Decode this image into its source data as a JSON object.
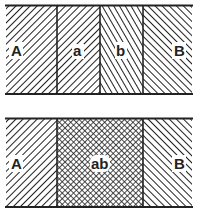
{
  "diagram": {
    "colors": {
      "line": "#222222",
      "background": "#ffffff"
    },
    "top_panel": {
      "regions": [
        {
          "label": "A",
          "pattern": "diagonal-hatch-right"
        },
        {
          "label": "a",
          "pattern": "diagonal-hatch-right"
        },
        {
          "label": "b",
          "pattern": "steep-diagonal-hatch-left"
        },
        {
          "label": "B",
          "pattern": "diagonal-hatch-left"
        }
      ]
    },
    "bottom_panel": {
      "regions": [
        {
          "label": "A",
          "pattern": "diagonal-hatch-right"
        },
        {
          "label": "ab",
          "pattern": "cross-hatch"
        },
        {
          "label": "B",
          "pattern": "diagonal-hatch-left"
        }
      ]
    }
  }
}
